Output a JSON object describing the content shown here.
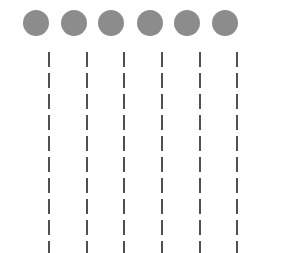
{
  "figure": {
    "dot_color": "#8c8c8c",
    "line_color": "#505050",
    "columns": [
      {
        "x": 36,
        "line_x": 49
      },
      {
        "x": 74,
        "line_x": 87
      },
      {
        "x": 111,
        "line_x": 124
      },
      {
        "x": 150,
        "line_x": 162
      },
      {
        "x": 187,
        "line_x": 200
      },
      {
        "x": 225,
        "line_x": 237
      }
    ]
  }
}
